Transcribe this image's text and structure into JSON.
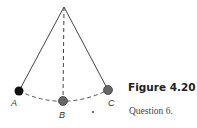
{
  "figure": {
    "title": "Figure 4.20",
    "caption": "Question 6."
  },
  "diagram": {
    "type": "pendulum",
    "pivot": {
      "x": 64,
      "y": 7
    },
    "positions": [
      {
        "label": "A",
        "x": 19,
        "y": 91,
        "color": "#111111"
      },
      {
        "label": "B",
        "x": 63,
        "y": 101,
        "color": "#666666"
      },
      {
        "label": "C",
        "x": 108,
        "y": 90,
        "color": "#666666"
      }
    ]
  }
}
